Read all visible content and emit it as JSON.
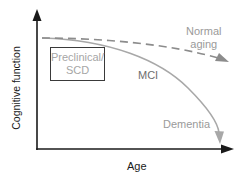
{
  "diagram": {
    "axes": {
      "y_label": "Cognitive function",
      "x_label": "Age"
    },
    "box_label": {
      "line1": "Preclinical/",
      "line2": "SCD"
    },
    "curves": {
      "normal": {
        "line1": "Normal",
        "line2": "aging",
        "style": "dashed",
        "color": "#8c8c8c"
      },
      "mci": {
        "label": "MCI",
        "color": "#a8a8a8"
      },
      "dementia": {
        "label": "Dementia",
        "color": "#a8a8a8"
      }
    },
    "colors": {
      "axis": "#1a1a1a",
      "curve": "#a8a8a8",
      "dashed": "#8c8c8c",
      "box_border": "#3a3a3a"
    }
  }
}
